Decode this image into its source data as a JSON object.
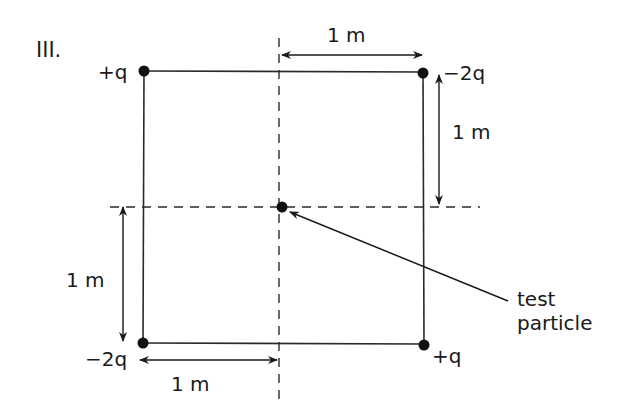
{
  "figure": {
    "panel_label": "III.",
    "charges": [
      {
        "id": "top-left",
        "sign": "+",
        "magnitude": "q",
        "label": "+q"
      },
      {
        "id": "top-right",
        "sign": "-",
        "magnitude": "2q",
        "label": "−2q"
      },
      {
        "id": "bottom-left",
        "sign": "-",
        "magnitude": "2q",
        "label": "−2q"
      },
      {
        "id": "bottom-right",
        "sign": "+",
        "magnitude": "q",
        "label": "+q"
      }
    ],
    "dimensions": {
      "top": "1 m",
      "right": "1 m",
      "left": "1 m",
      "bottom": "1 m"
    },
    "test_particle_label_line1": "test",
    "test_particle_label_line2": "particle",
    "colors": {
      "ink": "#1a1a1a",
      "background": "#ffffff"
    }
  }
}
